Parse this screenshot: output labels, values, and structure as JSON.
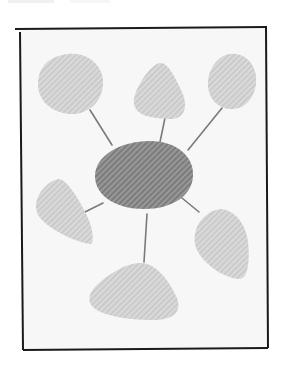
{
  "diagram": {
    "type": "hub-and-spoke",
    "colors": {
      "page_background": "#ffffff",
      "frame_background": "#f7f7f7",
      "frame_border": "#1a1a1a",
      "hub_fill": "#8c8c8c",
      "hub_hatch": "#6e6e6e",
      "satellite_fill": "#d2d2d2",
      "satellite_hatch": "#bdbdbd",
      "connector": "#7a7a7a"
    },
    "hub": {
      "id": "center",
      "label": "",
      "cx": 144,
      "cy": 174,
      "rx": 49,
      "ry": 34
    },
    "satellites": [
      {
        "id": "top-left",
        "label": "",
        "shape": "blob"
      },
      {
        "id": "top-center",
        "label": "",
        "shape": "rounded-triangle"
      },
      {
        "id": "top-right",
        "label": "",
        "shape": "blob"
      },
      {
        "id": "left",
        "label": "",
        "shape": "teardrop"
      },
      {
        "id": "bottom",
        "label": "",
        "shape": "rounded-triangle"
      },
      {
        "id": "bottom-right",
        "label": "",
        "shape": "teardrop"
      }
    ],
    "connectors": [
      {
        "from": "center",
        "to": "top-left"
      },
      {
        "from": "center",
        "to": "top-center"
      },
      {
        "from": "center",
        "to": "top-right"
      },
      {
        "from": "center",
        "to": "left"
      },
      {
        "from": "center",
        "to": "bottom"
      },
      {
        "from": "center",
        "to": "bottom-right"
      }
    ]
  }
}
